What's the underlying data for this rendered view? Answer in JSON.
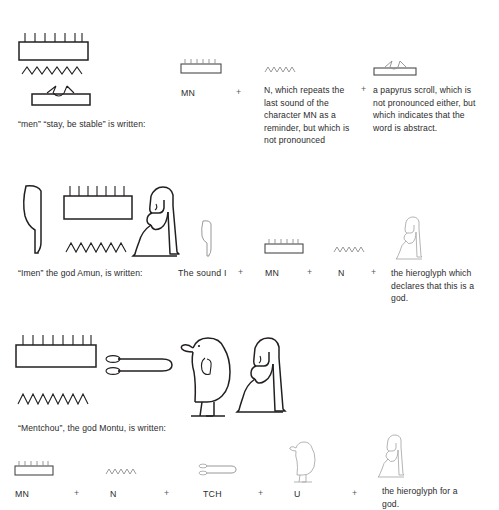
{
  "document": {
    "title": "Egyptian hieroglyph composition examples",
    "background_color": "#ffffff",
    "ink_color": "#231f20"
  },
  "sections": [
    {
      "id": "men",
      "caption": "“men” “stay, be stable” is written:",
      "word_glyphs": [
        {
          "name": "men-senet-game-board-glyph",
          "label": "MN"
        },
        {
          "name": "water-ripple-n-glyph",
          "label": "N"
        },
        {
          "name": "papyrus-scroll-glyph",
          "label": "papyrus scroll"
        }
      ],
      "breakdown": [
        {
          "glyph": "men-senet-game-board-glyph",
          "label": "MN",
          "description": "",
          "operator": "+"
        },
        {
          "glyph": "water-ripple-n-glyph",
          "label": "",
          "description": "N, which repeats the last sound of the character MN as a reminder, but which is not pronounced",
          "operator": "+"
        },
        {
          "glyph": "papyrus-scroll-glyph",
          "label": "",
          "description": "a papyrus scroll, which is not pronounced either, but which indicates that the word is abstract.",
          "operator": ""
        }
      ]
    },
    {
      "id": "imen",
      "caption": "“Imen” the god Amun, is written:",
      "word_glyphs": [
        {
          "name": "reed-leaf-i-glyph",
          "label": "I"
        },
        {
          "name": "men-senet-game-board-glyph",
          "label": "MN"
        },
        {
          "name": "water-ripple-n-glyph",
          "label": "N"
        },
        {
          "name": "seated-god-glyph",
          "label": "god determinative"
        }
      ],
      "breakdown": [
        {
          "glyph": "reed-leaf-i-glyph",
          "label": "The sound I",
          "description": "",
          "operator": "+"
        },
        {
          "glyph": "men-senet-game-board-glyph",
          "label": "MN",
          "description": "",
          "operator": "+"
        },
        {
          "glyph": "water-ripple-n-glyph",
          "label": "N",
          "description": "",
          "operator": "+"
        },
        {
          "glyph": "seated-god-glyph",
          "label": "",
          "description": "the hieroglyph which declares that this is a god.",
          "operator": ""
        }
      ]
    },
    {
      "id": "mentchou",
      "caption": "“Mentchou”, the god Montu, is written:",
      "word_glyphs": [
        {
          "name": "men-senet-game-board-glyph",
          "label": "MN"
        },
        {
          "name": "water-ripple-n-glyph",
          "label": "N"
        },
        {
          "name": "tethering-rope-tch-glyph",
          "label": "TCH"
        },
        {
          "name": "quail-chick-u-glyph",
          "label": "U"
        },
        {
          "name": "seated-god-glyph",
          "label": "god determinative"
        }
      ],
      "breakdown": [
        {
          "glyph": "men-senet-game-board-glyph",
          "label": "MN",
          "description": "",
          "operator": "+"
        },
        {
          "glyph": "water-ripple-n-glyph",
          "label": "N",
          "description": "",
          "operator": "+"
        },
        {
          "glyph": "tethering-rope-tch-glyph",
          "label": "TCH",
          "description": "",
          "operator": "+"
        },
        {
          "glyph": "quail-chick-u-glyph",
          "label": "U",
          "description": "",
          "operator": "+"
        },
        {
          "glyph": "seated-god-glyph",
          "label": "",
          "description": "the hieroglyph for a god.",
          "operator": ""
        }
      ]
    }
  ]
}
